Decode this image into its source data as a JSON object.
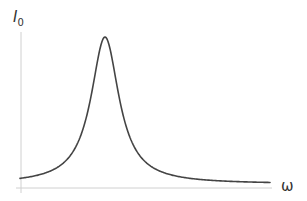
{
  "chart_data": {
    "type": "line",
    "title": "",
    "xlabel": "ω",
    "ylabel": "I0",
    "ylabel_main": "I",
    "ylabel_sub": "0",
    "grid": false,
    "legend": null,
    "axis_ticks": "none",
    "series": [
      {
        "name": "I0(ω)",
        "color": "#444444",
        "x_norm": [
          0.0,
          0.05,
          0.1,
          0.15,
          0.2,
          0.25,
          0.28,
          0.3,
          0.32,
          0.34,
          0.36,
          0.4,
          0.45,
          0.5,
          0.55,
          0.6,
          0.7,
          0.8,
          0.9,
          1.0
        ],
        "y_norm": [
          0.04,
          0.06,
          0.09,
          0.16,
          0.31,
          0.65,
          0.89,
          0.99,
          0.97,
          0.82,
          0.62,
          0.35,
          0.19,
          0.12,
          0.08,
          0.06,
          0.04,
          0.03,
          0.02,
          0.015
        ]
      }
    ]
  },
  "axes": {
    "x_label": "ω",
    "y_label_main": "I",
    "y_label_sub": "0"
  }
}
